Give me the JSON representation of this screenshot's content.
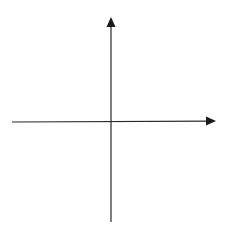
{
  "diagram": {
    "type": "cartesian-axes",
    "background": "#ffffff",
    "stroke_color": "#2a2a2a",
    "origin": {
      "x": 111,
      "y": 122
    },
    "x_axis": {
      "start": {
        "x": 12,
        "y": 122
      },
      "end": {
        "x": 216,
        "y": 121
      },
      "arrow": "right",
      "label": ""
    },
    "y_axis": {
      "start": {
        "x": 111,
        "y": 222
      },
      "end": {
        "x": 111,
        "y": 17
      },
      "arrow": "up",
      "label": ""
    }
  }
}
